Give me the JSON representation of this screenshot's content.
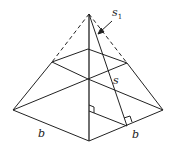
{
  "diagram": {
    "labels": {
      "s1": "s",
      "s1_sub": "1",
      "s": "s",
      "b_left": "b",
      "b_right": "b"
    },
    "colors": {
      "stroke": "#222222",
      "background": "#ffffff"
    }
  }
}
